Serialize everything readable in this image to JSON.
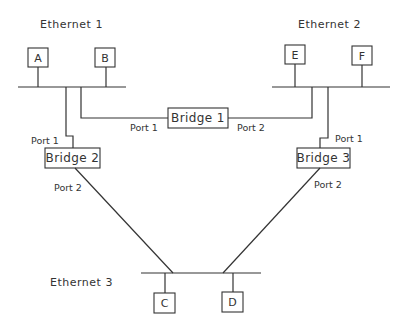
{
  "diagram": {
    "type": "network-topology",
    "networks": [
      {
        "id": "eth1",
        "label": "Ethernet 1",
        "hosts": [
          "A",
          "B"
        ]
      },
      {
        "id": "eth2",
        "label": "Ethernet 2",
        "hosts": [
          "E",
          "F"
        ]
      },
      {
        "id": "eth3",
        "label": "Ethernet 3",
        "hosts": [
          "C",
          "D"
        ]
      }
    ],
    "hosts": {
      "A": "A",
      "B": "B",
      "C": "C",
      "D": "D",
      "E": "E",
      "F": "F"
    },
    "bridges": [
      {
        "id": "bridge1",
        "label": "Bridge 1",
        "port1": "Port 1",
        "port2": "Port 2",
        "port1_net": "Ethernet 1",
        "port2_net": "Ethernet 2"
      },
      {
        "id": "bridge2",
        "label": "Bridge 2",
        "port1": "Port 1",
        "port2": "Port 2",
        "port1_net": "Ethernet 1",
        "port2_net": "Ethernet 3"
      },
      {
        "id": "bridge3",
        "label": "Bridge 3",
        "port1": "Port 1",
        "port2": "Port 2",
        "port1_net": "Ethernet 2",
        "port2_net": "Ethernet 3"
      }
    ],
    "colors": {
      "stroke": "#333333",
      "background": "#ffffff"
    }
  }
}
